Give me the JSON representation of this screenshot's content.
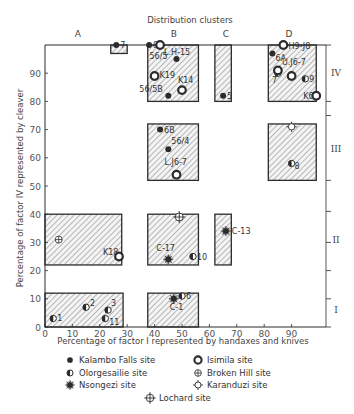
{
  "chart_data": {
    "type": "scatter",
    "title": "Distribution clusters",
    "xlabel": "Percentage of factor I represented by handaxes and knives",
    "ylabel": "Percentage of factor IV represented by cleaver",
    "xlim": [
      0,
      100
    ],
    "ylim": [
      0,
      100
    ],
    "x_ticks": [
      0,
      10,
      20,
      30,
      40,
      50,
      60,
      70,
      80,
      90
    ],
    "y_ticks": [
      0,
      10,
      20,
      30,
      40,
      50,
      60,
      70,
      80,
      90
    ],
    "grid": false,
    "legend_position": "bottom",
    "column_clusters": [
      {
        "label": "A",
        "x": 12
      },
      {
        "label": "B",
        "x": 47
      },
      {
        "label": "C",
        "x": 66
      },
      {
        "label": "D",
        "x": 89
      }
    ],
    "row_clusters": [
      {
        "label": "IV",
        "y": 90
      },
      {
        "label": "III",
        "y": 63
      },
      {
        "label": "II",
        "y": 31
      },
      {
        "label": "I",
        "y": 6
      }
    ],
    "right_axis_ticks_y": [
      100,
      80,
      75,
      52,
      41,
      30,
      20,
      10,
      0
    ],
    "cluster_boxes": [
      {
        "x0": 24,
        "x1": 30,
        "y0": 97,
        "y1": 100
      },
      {
        "x0": 37.5,
        "x1": 56,
        "y0": 80,
        "y1": 100
      },
      {
        "x0": 62,
        "x1": 68,
        "y0": 80,
        "y1": 100
      },
      {
        "x0": 81.5,
        "x1": 99,
        "y0": 80,
        "y1": 100
      },
      {
        "x0": 37.5,
        "x1": 56,
        "y0": 52,
        "y1": 72
      },
      {
        "x0": 81.5,
        "x1": 99,
        "y0": 52,
        "y1": 72
      },
      {
        "x0": 0,
        "x1": 28,
        "y0": 22,
        "y1": 40
      },
      {
        "x0": 37.5,
        "x1": 56,
        "y0": 22,
        "y1": 40
      },
      {
        "x0": 62,
        "x1": 68,
        "y0": 22,
        "y1": 40
      },
      {
        "x0": 0,
        "x1": 28.5,
        "y0": 0,
        "y1": 12
      },
      {
        "x0": 37.5,
        "x1": 56,
        "y0": 0,
        "y1": 12
      }
    ],
    "series": [
      {
        "name": "Kalambo Falls site",
        "marker": "filled-circle",
        "points": [
          {
            "label": "7",
            "x": 26,
            "y": 100
          },
          {
            "label": "8",
            "x": 38,
            "y": 100
          },
          {
            "label": "56/5",
            "x": 48,
            "y": 95
          },
          {
            "label": "56/5B",
            "x": 45,
            "y": 82
          },
          {
            "label": "5",
            "x": 65,
            "y": 82
          },
          {
            "label": "6A",
            "x": 83,
            "y": 97
          },
          {
            "label": "6B",
            "x": 42,
            "y": 70
          },
          {
            "label": "56/4",
            "x": 45,
            "y": 63
          }
        ]
      },
      {
        "name": "Olorgesailie site",
        "marker": "half-circle",
        "points": [
          {
            "label": "7",
            "x": 85,
            "y": 90
          },
          {
            "label": "9",
            "x": 95,
            "y": 88
          },
          {
            "label": "8",
            "x": 90,
            "y": 58
          },
          {
            "label": "10",
            "x": 54,
            "y": 25
          },
          {
            "label": "1",
            "x": 3,
            "y": 3
          },
          {
            "label": "2",
            "x": 15,
            "y": 7
          },
          {
            "label": "3",
            "x": 23,
            "y": 6
          },
          {
            "label": "11",
            "x": 22,
            "y": 3
          },
          {
            "label": "6",
            "x": 50,
            "y": 11
          }
        ]
      },
      {
        "name": "Nsongezi site",
        "marker": "starburst",
        "points": [
          {
            "label": "C-13",
            "x": 66,
            "y": 34
          },
          {
            "label": "C-17",
            "x": 45,
            "y": 24
          },
          {
            "label": "C-1",
            "x": 47,
            "y": 10
          }
        ]
      },
      {
        "name": "Isimila site",
        "marker": "open-circle",
        "points": [
          {
            "label": "L.H-15",
            "x": 42,
            "y": 100
          },
          {
            "label": "K19",
            "x": 40,
            "y": 89
          },
          {
            "label": "K14",
            "x": 50,
            "y": 84
          },
          {
            "label": "L.J6-7",
            "x": 48,
            "y": 54
          },
          {
            "label": "H9-J8",
            "x": 87,
            "y": 100
          },
          {
            "label": "U.J6-7",
            "x": 85,
            "y": 91
          },
          {
            "label": "",
            "x": 90,
            "y": 89
          },
          {
            "label": "K6",
            "x": 99,
            "y": 82
          },
          {
            "label": "K18",
            "x": 27,
            "y": 25
          }
        ]
      },
      {
        "name": "Broken Hill site",
        "marker": "circle-plus",
        "points": [
          {
            "label": "",
            "x": 5,
            "y": 31
          }
        ]
      },
      {
        "name": "Karanduzi site",
        "marker": "open-diamond-circle",
        "points": [
          {
            "label": "",
            "x": 90,
            "y": 71
          }
        ]
      },
      {
        "name": "Lochard site",
        "marker": "crosshair",
        "points": [
          {
            "label": "",
            "x": 49,
            "y": 39
          }
        ]
      }
    ]
  },
  "legend": {
    "items": [
      {
        "label": "Kalambo Falls site",
        "marker": "filled-circle",
        "col": 0,
        "row": 0
      },
      {
        "label": "Olorgesailie site",
        "marker": "half-circle",
        "col": 0,
        "row": 1
      },
      {
        "label": "Nsongezi site",
        "marker": "starburst",
        "col": 0,
        "row": 2
      },
      {
        "label": "Isimila site",
        "marker": "open-circle",
        "col": 1,
        "row": 0
      },
      {
        "label": "Broken Hill site",
        "marker": "circle-plus",
        "col": 1,
        "row": 1
      },
      {
        "label": "Karanduzi site",
        "marker": "open-diamond-circle",
        "col": 1,
        "row": 2
      },
      {
        "label": "Lochard site",
        "marker": "crosshair",
        "col": 2,
        "row": 3
      }
    ]
  },
  "colors": {
    "ink": "#2b2b2b",
    "hatch": "#6e6e6e",
    "box_fill": "#f3f3f3",
    "background": "#ffffff"
  }
}
